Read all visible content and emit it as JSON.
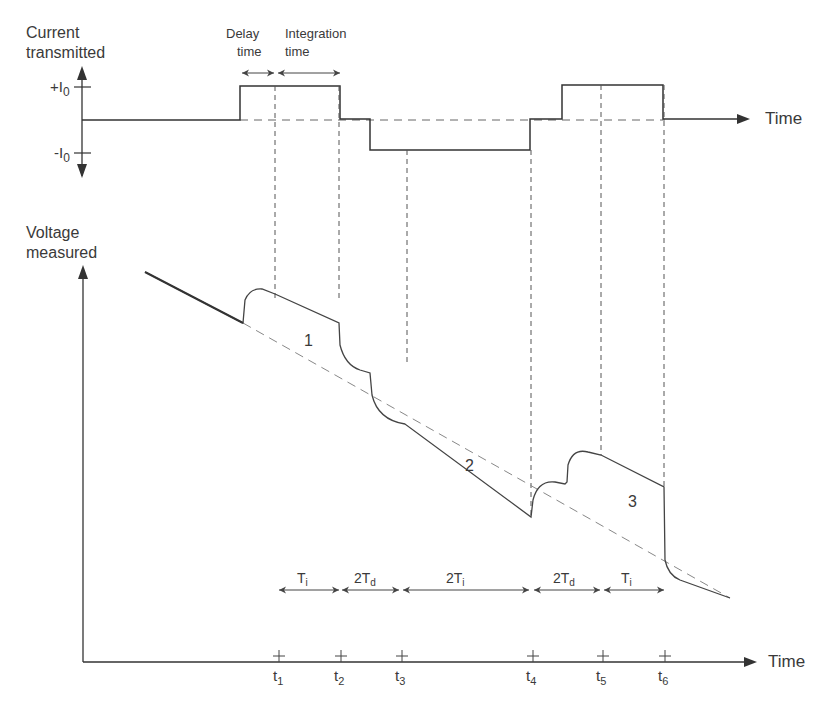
{
  "top_panel": {
    "y_label_line1": "Current",
    "y_label_line2": "transmitted",
    "plus_label": "+I",
    "plus_sub": "0",
    "minus_label": "-I",
    "minus_sub": "0",
    "x_label": "Time",
    "delay_label_1": "Delay",
    "delay_label_2": "time",
    "integration_label_1": "Integration",
    "integration_label_2": "time"
  },
  "bottom_panel": {
    "y_label_line1": "Voltage",
    "y_label_line2": "measured",
    "x_label": "Time",
    "region_labels": [
      "1",
      "2",
      "3"
    ],
    "intervals": [
      {
        "main": "T",
        "sub": "i"
      },
      {
        "main": "2T",
        "sub": "d"
      },
      {
        "main": "2T",
        "sub": "i"
      },
      {
        "main": "2T",
        "sub": "d"
      },
      {
        "main": "T",
        "sub": "i"
      }
    ],
    "ticks": [
      {
        "main": "t",
        "sub": "1"
      },
      {
        "main": "t",
        "sub": "2"
      },
      {
        "main": "t",
        "sub": "3"
      },
      {
        "main": "t",
        "sub": "4"
      },
      {
        "main": "t",
        "sub": "5"
      },
      {
        "main": "t",
        "sub": "6"
      }
    ]
  },
  "colors": {
    "line": "#3a3a3a",
    "dashed": "#8a8a8a",
    "background": "#ffffff"
  }
}
